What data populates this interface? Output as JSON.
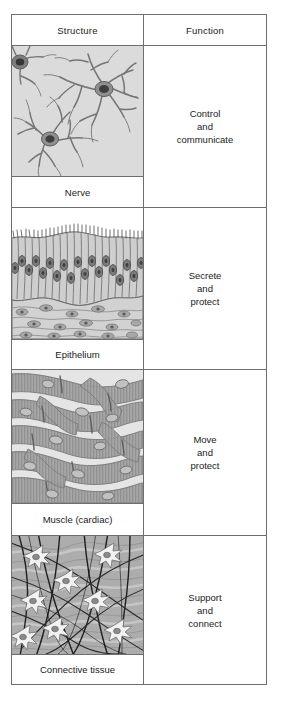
{
  "table": {
    "headers": {
      "structure": "Structure",
      "function": "Function"
    },
    "rows": [
      {
        "tissue": "nerve",
        "caption": "Nerve",
        "function": "Control\nand\ncommunicate",
        "function_lines": [
          "Control",
          "and",
          "communicate"
        ]
      },
      {
        "tissue": "epithelium",
        "caption": "Epithelium",
        "function": "Secrete\nand\nprotect",
        "function_lines": [
          "Secrete",
          "and",
          "protect"
        ]
      },
      {
        "tissue": "muscle-cardiac",
        "caption": "Muscle (cardiac)",
        "function": "Move\nand\nprotect",
        "function_lines": [
          "Move",
          "and",
          "protect"
        ]
      },
      {
        "tissue": "connective",
        "caption": "Connective tissue",
        "function": "Support\nand\nconnect",
        "function_lines": [
          "Support",
          "and",
          "connect"
        ]
      }
    ]
  },
  "colors": {
    "border": "#6e6e6e",
    "text": "#1b1b1b",
    "background": "#ffffff",
    "micrograph_light": "#e3e3e3",
    "micrograph_mid": "#b9b9b9",
    "micrograph_dark": "#6f6f6f",
    "nucleus": "#4a4a4a"
  }
}
